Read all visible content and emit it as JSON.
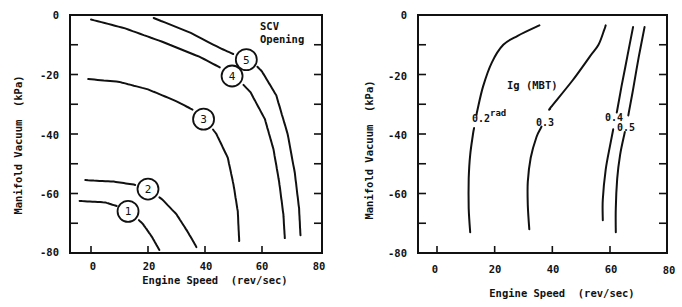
{
  "chart_data": [
    {
      "type": "line",
      "title": "",
      "xlabel": "Engine Speed  (rev/sec)",
      "ylabel": "Manifold Vacuum  (kPa)",
      "xlim": [
        -8,
        80
      ],
      "ylim": [
        -80,
        0
      ],
      "xticks": [
        "0",
        "20",
        "40",
        "60",
        "80"
      ],
      "yticks": [
        "0",
        "-20",
        "-40",
        "-60",
        "-80"
      ],
      "grid": false,
      "annotation": "SCV Opening",
      "series": [
        {
          "name": "1",
          "points": [
            [
              -4,
              -62.5
            ],
            [
              5,
              -63
            ],
            [
              10,
              -64.5
            ],
            [
              14,
              -66.5
            ],
            [
              18,
              -70
            ],
            [
              21,
              -74
            ],
            [
              24,
              -79
            ]
          ]
        },
        {
          "name": "2",
          "points": [
            [
              -2,
              -55.5
            ],
            [
              8,
              -56
            ],
            [
              15,
              -57
            ],
            [
              20,
              -58.5
            ],
            [
              25,
              -62
            ],
            [
              30,
              -67
            ],
            [
              34,
              -73
            ],
            [
              37,
              -78
            ]
          ]
        },
        {
          "name": "3",
          "points": [
            [
              -1,
              -21.5
            ],
            [
              10,
              -22.5
            ],
            [
              20,
              -25
            ],
            [
              30,
              -29
            ],
            [
              37,
              -32.5
            ],
            [
              40,
              -35
            ],
            [
              44,
              -40
            ],
            [
              48,
              -48
            ],
            [
              50,
              -57
            ],
            [
              51.5,
              -66
            ],
            [
              52,
              -76
            ]
          ]
        },
        {
          "name": "4",
          "points": [
            [
              0,
              -1.5
            ],
            [
              12,
              -4.5
            ],
            [
              25,
              -9
            ],
            [
              38,
              -14
            ],
            [
              46,
              -18
            ],
            [
              51,
              -21
            ],
            [
              56,
              -26
            ],
            [
              61,
              -35
            ],
            [
              64,
              -45
            ],
            [
              66,
              -56
            ],
            [
              67.5,
              -67
            ],
            [
              68,
              -75
            ]
          ]
        },
        {
          "name": "5",
          "points": [
            [
              22,
              -1
            ],
            [
              35,
              -6
            ],
            [
              45,
              -11
            ],
            [
              52,
              -14
            ],
            [
              56,
              -15
            ],
            [
              60,
              -19
            ],
            [
              65,
              -27
            ],
            [
              69,
              -40
            ],
            [
              71.5,
              -53
            ],
            [
              73,
              -65
            ],
            [
              73.5,
              -74
            ]
          ]
        }
      ]
    },
    {
      "type": "line",
      "title": "Ig (MBT)",
      "xlabel": "Engine Speed  (rev/sec)",
      "ylabel": "Manifold Vacuum  (kPa)",
      "xlim": [
        -6,
        80
      ],
      "ylim": [
        -80,
        0
      ],
      "xticks": [
        "0",
        "20",
        "40",
        "60",
        "80"
      ],
      "yticks": [
        "0",
        "-20",
        "-40",
        "-60",
        "-80"
      ],
      "grid": false,
      "unit_annotation": "rad",
      "series": [
        {
          "name": "0.2",
          "points": [
            [
              11.5,
              -73
            ],
            [
              11,
              -65
            ],
            [
              11,
              -55
            ],
            [
              11.5,
              -47
            ],
            [
              12.5,
              -40
            ],
            [
              14,
              -32
            ],
            [
              16,
              -24
            ],
            [
              19,
              -16
            ],
            [
              23,
              -10
            ],
            [
              28,
              -7
            ],
            [
              35.5,
              -3.5
            ]
          ]
        },
        {
          "name": "0.3",
          "points": [
            [
              32,
              -72
            ],
            [
              31.5,
              -64
            ],
            [
              31.5,
              -56
            ],
            [
              32.5,
              -48
            ],
            [
              34.5,
              -41
            ],
            [
              36,
              -38
            ],
            [
              39.5,
              -31
            ],
            [
              47,
              -22
            ],
            [
              53,
              -14
            ],
            [
              56,
              -10
            ],
            [
              58,
              -5
            ],
            [
              58.5,
              -3.5
            ]
          ]
        },
        {
          "name": "0.4",
          "points": [
            [
              57.5,
              -69
            ],
            [
              57.5,
              -62
            ],
            [
              58.5,
              -52
            ],
            [
              60,
              -44
            ],
            [
              61,
              -39
            ],
            [
              62.5,
              -32
            ],
            [
              64,
              -24
            ],
            [
              66,
              -14
            ],
            [
              68,
              -4
            ]
          ]
        },
        {
          "name": "0.5",
          "points": [
            [
              62,
              -73
            ],
            [
              62,
              -65
            ],
            [
              62.5,
              -55
            ],
            [
              63.5,
              -47
            ],
            [
              65,
              -40
            ],
            [
              66.5,
              -33
            ],
            [
              68,
              -25
            ],
            [
              70,
              -14
            ],
            [
              72,
              -4
            ]
          ]
        }
      ]
    }
  ],
  "left_chart": {
    "ylabel": "Manifold Vacuum  (kPa)",
    "xlabel": "Engine Speed  (rev/sec)",
    "annotation_line1": "SCV",
    "annotation_line2": "Opening",
    "yticks": [
      "0",
      "-20",
      "-40",
      "-60",
      "-80"
    ],
    "xticks": [
      "0",
      "20",
      "40",
      "60",
      "80"
    ],
    "markers": [
      "1",
      "2",
      "3",
      "4",
      "5"
    ]
  },
  "right_chart": {
    "ylabel": "Manifold Vacuum  (kPa)",
    "xlabel": "Engine Speed  (rev/sec)",
    "title": "Ig (MBT)",
    "unit": "rad",
    "yticks": [
      "0",
      "-20",
      "-40",
      "-60",
      "-80"
    ],
    "xticks": [
      "0",
      "20",
      "40",
      "60",
      "80"
    ],
    "labels": [
      "0.2",
      "0.3",
      "0.4",
      "0.5"
    ]
  }
}
